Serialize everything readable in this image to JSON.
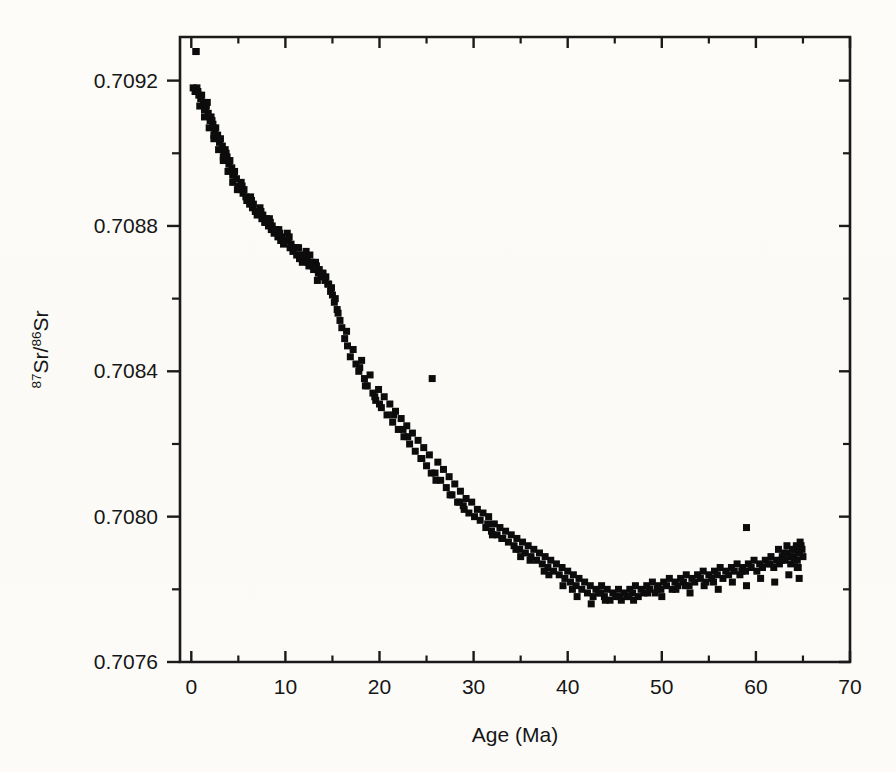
{
  "figure": {
    "background_color": "#fdfdfb",
    "ink_color": "#121212"
  },
  "chart_data": {
    "type": "scatter",
    "title": "",
    "subtitle": "",
    "xlabel": "Age (Ma)",
    "ylabel": "87Sr/86Sr",
    "ylabel_parts": {
      "sup1": "87",
      "base1": "Sr/",
      "sup2": "86",
      "base2": "Sr"
    },
    "xlim": [
      -1.2,
      70
    ],
    "ylim": [
      0.7076,
      0.70932
    ],
    "xticks": [
      0,
      10,
      20,
      30,
      40,
      50,
      60,
      70
    ],
    "xticklabels": [
      "0",
      "10",
      "20",
      "30",
      "40",
      "50",
      "60",
      "70"
    ],
    "xminorticks": [
      5,
      15,
      25,
      35,
      45,
      55,
      65
    ],
    "yticks": [
      0.7076,
      0.708,
      0.7084,
      0.7088,
      0.7092
    ],
    "yticklabels": [
      "0.7076",
      "0.7080",
      "0.7084",
      "0.7088",
      "0.7092"
    ],
    "yminorticks": [
      0.7078,
      0.7082,
      0.7086,
      0.709
    ],
    "grid": false,
    "legend": null,
    "marker": "square",
    "marker_size_px": 7,
    "marker_color": "#0c0c0c",
    "series": [
      {
        "name": "Cenozoic seawater Sr isotope ratio",
        "x": [
          0.2,
          0.5,
          0.4,
          0.8,
          0.6,
          1.0,
          0.9,
          1.3,
          1.1,
          1.5,
          1.4,
          1.8,
          1.6,
          2.0,
          1.9,
          2.3,
          2.1,
          2.5,
          2.4,
          2.8,
          2.6,
          3.0,
          2.9,
          3.3,
          3.1,
          3.5,
          3.4,
          3.8,
          3.6,
          4.0,
          3.9,
          4.3,
          4.1,
          4.5,
          4.4,
          4.8,
          4.6,
          5.0,
          5.2,
          5.5,
          5.3,
          5.8,
          5.6,
          6.0,
          6.2,
          6.5,
          6.3,
          6.8,
          6.6,
          7.0,
          7.2,
          7.5,
          7.3,
          7.8,
          7.6,
          8.0,
          8.2,
          8.5,
          8.3,
          8.8,
          8.6,
          9.0,
          9.2,
          9.5,
          9.3,
          9.8,
          9.6,
          10.0,
          10.2,
          10.5,
          10.3,
          10.8,
          10.6,
          11.0,
          11.2,
          11.5,
          11.3,
          11.8,
          11.6,
          12.0,
          12.2,
          12.5,
          12.3,
          12.8,
          12.6,
          13.0,
          13.2,
          13.5,
          13.3,
          13.8,
          13.6,
          14.0,
          14.2,
          14.5,
          14.3,
          14.8,
          14.6,
          15.0,
          15.2,
          15.5,
          15.3,
          15.8,
          15.6,
          16.0,
          16.3,
          16.6,
          16.9,
          17.2,
          17.5,
          17.8,
          18.1,
          18.4,
          18.7,
          19.0,
          19.3,
          19.6,
          19.9,
          20.2,
          20.5,
          20.8,
          21.1,
          21.4,
          21.7,
          22.0,
          22.3,
          22.6,
          22.9,
          23.2,
          23.5,
          23.8,
          24.1,
          24.4,
          24.7,
          25.0,
          25.3,
          25.6,
          25.9,
          26.2,
          26.5,
          26.8,
          27.1,
          27.4,
          27.7,
          28.0,
          28.3,
          28.6,
          28.9,
          29.2,
          29.5,
          29.8,
          30.1,
          30.4,
          30.7,
          31.0,
          31.3,
          31.6,
          31.9,
          32.2,
          32.5,
          32.8,
          33.1,
          33.4,
          33.7,
          34.0,
          34.3,
          34.6,
          34.9,
          35.2,
          35.5,
          35.8,
          36.1,
          36.4,
          36.7,
          37.0,
          37.3,
          37.6,
          37.9,
          38.2,
          38.5,
          38.8,
          39.1,
          39.4,
          39.7,
          40.0,
          40.3,
          40.6,
          40.9,
          41.2,
          41.5,
          41.8,
          42.1,
          42.4,
          42.7,
          43.0,
          43.3,
          43.6,
          43.9,
          44.2,
          44.5,
          44.8,
          45.1,
          45.4,
          45.7,
          46.0,
          46.3,
          46.6,
          46.9,
          47.2,
          47.5,
          47.8,
          48.1,
          48.4,
          48.7,
          49.0,
          49.3,
          49.6,
          49.9,
          50.2,
          50.5,
          50.8,
          51.1,
          51.4,
          51.7,
          52.0,
          52.3,
          52.6,
          52.9,
          53.2,
          53.5,
          53.8,
          54.1,
          54.4,
          54.7,
          55.0,
          55.3,
          55.6,
          55.9,
          56.2,
          56.5,
          56.8,
          57.1,
          57.4,
          57.7,
          58.0,
          58.3,
          58.6,
          58.9,
          59.2,
          59.5,
          59.8,
          60.1,
          60.4,
          60.7,
          61.0,
          61.3,
          61.6,
          61.9,
          62.2,
          62.5,
          62.8,
          63.1,
          63.4,
          63.7,
          64.0,
          64.2,
          64.4,
          64.6,
          64.8,
          65.0,
          64.9,
          64.7,
          64.5,
          64.3,
          64.1,
          63.9,
          63.6,
          63.3,
          63.0,
          62.7,
          62.4,
          1.7,
          2.2,
          3.7,
          4.9,
          5.9,
          6.9,
          7.9,
          8.9,
          9.9,
          10.9,
          11.9,
          12.9,
          13.9,
          14.9,
          16.5,
          17.9,
          19.5,
          21.5,
          23.0,
          24.5,
          26.0,
          27.5,
          29.0,
          31.5,
          33.0,
          34.5,
          36.0,
          38.0,
          39.5,
          41.0,
          42.5,
          44.0,
          45.5,
          47.0,
          48.5,
          50.0,
          51.5,
          53.0,
          54.5,
          56.0,
          57.5,
          59.0,
          60.5,
          62.0,
          63.5,
          64.5,
          13.4,
          12.4,
          11.4,
          10.4,
          9.4,
          8.4,
          7.4,
          6.4,
          5.4,
          4.4,
          3.4,
          2.4,
          1.4,
          0.7,
          18.5,
          20.0,
          22.5,
          25.5,
          28.5,
          32.0,
          35.0,
          37.5,
          40.5,
          43.5,
          46.5,
          49.5,
          52.5,
          55.5,
          58.5,
          61.5,
          59.0,
          0.5,
          64.4,
          64.6
        ],
        "y": [
          0.70918,
          0.70928,
          0.70917,
          0.70916,
          0.70918,
          0.70915,
          0.70913,
          0.70914,
          0.70916,
          0.70912,
          0.7091,
          0.70911,
          0.70913,
          0.70909,
          0.70907,
          0.70908,
          0.7091,
          0.70906,
          0.70904,
          0.70905,
          0.70907,
          0.70903,
          0.70901,
          0.70902,
          0.70904,
          0.709,
          0.70898,
          0.70899,
          0.70901,
          0.70897,
          0.70895,
          0.70896,
          0.70898,
          0.70894,
          0.70892,
          0.70893,
          0.70895,
          0.70891,
          0.7089,
          0.70889,
          0.70892,
          0.70888,
          0.7089,
          0.70887,
          0.70886,
          0.70885,
          0.70888,
          0.70884,
          0.70886,
          0.70883,
          0.70884,
          0.70882,
          0.70885,
          0.70881,
          0.70883,
          0.70882,
          0.7088,
          0.70879,
          0.70882,
          0.70878,
          0.7088,
          0.70879,
          0.70877,
          0.70876,
          0.70879,
          0.70875,
          0.70877,
          0.70876,
          0.70878,
          0.70874,
          0.70876,
          0.70873,
          0.70875,
          0.70874,
          0.70872,
          0.70871,
          0.70874,
          0.7087,
          0.70872,
          0.70871,
          0.70873,
          0.70869,
          0.70871,
          0.7087,
          0.70872,
          0.70868,
          0.7087,
          0.70867,
          0.70869,
          0.70866,
          0.70868,
          0.70867,
          0.70865,
          0.70864,
          0.70866,
          0.70862,
          0.70864,
          0.70861,
          0.70859,
          0.70857,
          0.7086,
          0.70854,
          0.70856,
          0.70852,
          0.70849,
          0.70847,
          0.70844,
          0.70846,
          0.70842,
          0.7084,
          0.70843,
          0.70838,
          0.70836,
          0.70839,
          0.70834,
          0.70832,
          0.70835,
          0.7083,
          0.70833,
          0.70828,
          0.70831,
          0.70826,
          0.70829,
          0.70824,
          0.70827,
          0.70822,
          0.70825,
          0.7082,
          0.70823,
          0.70818,
          0.70821,
          0.70816,
          0.70819,
          0.70814,
          0.70817,
          0.70838,
          0.70812,
          0.70815,
          0.7081,
          0.70813,
          0.70808,
          0.70811,
          0.70806,
          0.70809,
          0.70804,
          0.70807,
          0.70803,
          0.70805,
          0.70801,
          0.70804,
          0.708,
          0.70802,
          0.70799,
          0.70801,
          0.70797,
          0.708,
          0.70796,
          0.70798,
          0.70795,
          0.70797,
          0.70794,
          0.70796,
          0.70793,
          0.70795,
          0.70792,
          0.70794,
          0.70791,
          0.70793,
          0.7079,
          0.70792,
          0.70789,
          0.70791,
          0.70788,
          0.7079,
          0.70787,
          0.70789,
          0.70786,
          0.70788,
          0.70785,
          0.70787,
          0.70784,
          0.70786,
          0.70783,
          0.70785,
          0.70782,
          0.70784,
          0.70781,
          0.70783,
          0.7078,
          0.70782,
          0.70779,
          0.70781,
          0.70778,
          0.7078,
          0.70779,
          0.70781,
          0.70778,
          0.7078,
          0.70777,
          0.70779,
          0.70778,
          0.7078,
          0.70777,
          0.70779,
          0.70778,
          0.7078,
          0.70779,
          0.70781,
          0.70778,
          0.7078,
          0.70779,
          0.70781,
          0.7078,
          0.70782,
          0.70779,
          0.70781,
          0.7078,
          0.70782,
          0.70781,
          0.70783,
          0.7078,
          0.70782,
          0.70781,
          0.70783,
          0.70782,
          0.70784,
          0.70781,
          0.70783,
          0.70782,
          0.70784,
          0.70783,
          0.70785,
          0.70782,
          0.70784,
          0.70783,
          0.70785,
          0.70784,
          0.70786,
          0.70783,
          0.70785,
          0.70784,
          0.70786,
          0.70785,
          0.70787,
          0.70784,
          0.70786,
          0.70785,
          0.70787,
          0.70786,
          0.70788,
          0.70785,
          0.70787,
          0.70786,
          0.70788,
          0.70787,
          0.70789,
          0.70786,
          0.70788,
          0.70787,
          0.70789,
          0.70788,
          0.7079,
          0.70787,
          0.70789,
          0.70791,
          0.70788,
          0.7079,
          0.70792,
          0.70789,
          0.70791,
          0.70793,
          0.7079,
          0.70792,
          0.70788,
          0.70791,
          0.70789,
          0.70792,
          0.7079,
          0.70788,
          0.70791,
          0.70914,
          0.70909,
          0.709,
          0.7089,
          0.70887,
          0.70884,
          0.70881,
          0.70879,
          0.70876,
          0.70874,
          0.70872,
          0.70869,
          0.70867,
          0.70863,
          0.70851,
          0.70841,
          0.70833,
          0.70828,
          0.70822,
          0.70816,
          0.7081,
          0.70806,
          0.70802,
          0.70798,
          0.70794,
          0.70791,
          0.70788,
          0.70784,
          0.70781,
          0.70778,
          0.70776,
          0.70777,
          0.70778,
          0.70777,
          0.70779,
          0.70778,
          0.7078,
          0.70779,
          0.70781,
          0.7078,
          0.70782,
          0.70781,
          0.70783,
          0.70782,
          0.70784,
          0.70786,
          0.70865,
          0.7087,
          0.70874,
          0.70877,
          0.70878,
          0.70881,
          0.70884,
          0.70887,
          0.70891,
          0.70894,
          0.70899,
          0.70905,
          0.70912,
          0.70917,
          0.70836,
          0.70831,
          0.70824,
          0.70812,
          0.70804,
          0.70795,
          0.70789,
          0.70785,
          0.7078,
          0.70779,
          0.70778,
          0.7078,
          0.70781,
          0.70782,
          0.70785,
          0.70787,
          0.70797,
          0.70928,
          0.70786,
          0.70783
        ]
      }
    ],
    "annotations": [
      {
        "text": "declining trend from 0 to ~38 Ma",
        "visible": false
      },
      {
        "text": "minimum near 38-42 Ma",
        "visible": false
      }
    ]
  }
}
